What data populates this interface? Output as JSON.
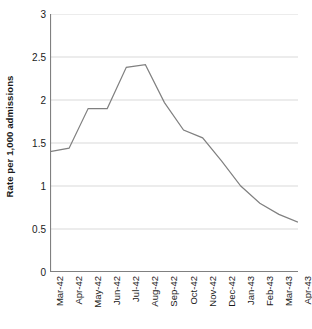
{
  "chart_data": {
    "type": "line",
    "title": "",
    "subtitle": "",
    "xlabel": "",
    "ylabel": "Rate per 1,000 admissions",
    "categories": [
      "Mar-42",
      "Apr-42",
      "May-42",
      "Jun-42",
      "Jul-42",
      "Aug-42",
      "Sep-42",
      "Oct-42",
      "Nov-42",
      "Dec-42",
      "Jan-43",
      "Feb-43",
      "Mar-43",
      "Apr-43"
    ],
    "values": [
      1.4,
      1.44,
      1.9,
      1.9,
      2.38,
      2.41,
      1.97,
      1.65,
      1.56,
      1.29,
      1.0,
      0.8,
      0.67,
      0.58
    ],
    "series": [
      {
        "name": "Rate per 1,000 admissions",
        "values": [
          1.4,
          1.44,
          1.9,
          1.9,
          2.38,
          2.41,
          1.97,
          1.65,
          1.56,
          1.29,
          1.0,
          0.8,
          0.67,
          0.58
        ]
      }
    ],
    "ylim": [
      0,
      3
    ],
    "ytick_values": [
      0,
      0.5,
      1,
      1.5,
      2,
      2.5,
      3
    ],
    "ytick_labels": [
      "0",
      "0.5",
      "1",
      "1.5",
      "2",
      "2.5",
      "3"
    ],
    "grid": true,
    "grid_axis": "y",
    "legend": false,
    "legend_position": "none",
    "line_color": "#808080",
    "grid_color": "#d9d9d9",
    "axis_color": "#808080",
    "background_color": "#ffffff",
    "text_color": "#1a1a1a",
    "annotations": []
  }
}
